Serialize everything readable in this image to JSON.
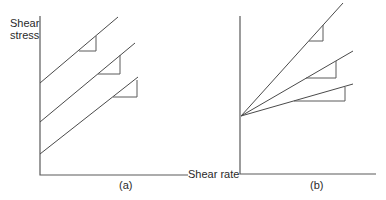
{
  "figure": {
    "y_axis_label_line1": "Shear",
    "y_axis_label_line2": "stress",
    "x_axis_label": "Shear rate",
    "panel_a_label": "(a)",
    "panel_b_label": "(b)"
  },
  "panels": [
    {
      "id": "a",
      "description": "Parallel lines with equal slope and different yield stress intercepts",
      "lines": [
        {
          "intercept_rank": "high",
          "slope": "equal"
        },
        {
          "intercept_rank": "medium",
          "slope": "equal"
        },
        {
          "intercept_rank": "low",
          "slope": "equal"
        }
      ]
    },
    {
      "id": "b",
      "description": "Lines with common intercept and different slopes",
      "lines": [
        {
          "slope_rank": "steep"
        },
        {
          "slope_rank": "medium"
        },
        {
          "slope_rank": "shallow"
        }
      ]
    }
  ]
}
